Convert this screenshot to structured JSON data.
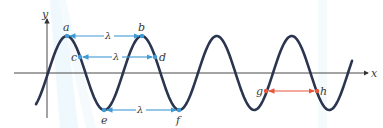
{
  "diagram": {
    "axes": {
      "x_label": "x",
      "y_label": "y"
    },
    "wave": {
      "color": "#2b3550",
      "period_px": 75,
      "amplitude_px": 37
    },
    "measurements": [
      {
        "from": "a",
        "to": "b",
        "label": "λ",
        "color": "#3f9ad6"
      },
      {
        "from": "c",
        "to": "d",
        "label": "λ",
        "color": "#3f9ad6"
      },
      {
        "from": "e",
        "to": "f",
        "label": "λ",
        "color": "#3f9ad6"
      },
      {
        "from": "g",
        "to": "h",
        "label": "",
        "color": "#e8573a"
      }
    ],
    "points": {
      "a": "a",
      "b": "b",
      "c": "c",
      "d": "d",
      "e": "e",
      "f": "f",
      "g": "g",
      "h": "h"
    },
    "lambda": "λ"
  }
}
